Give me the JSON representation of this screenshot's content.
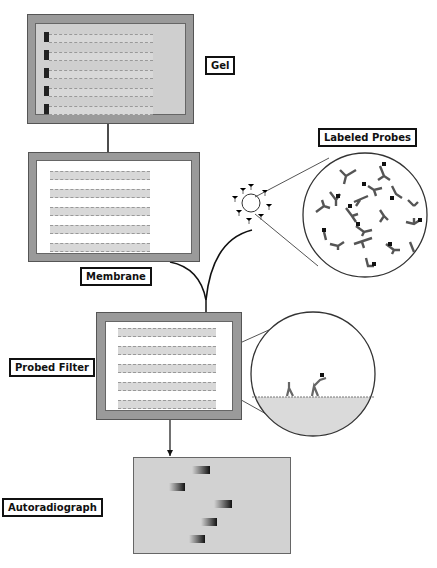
{
  "labels": {
    "gel": "Gel",
    "membrane": "Membrane",
    "labeled_probes": "Labeled Probes",
    "probed_filter": "Probed Filter",
    "autoradiograph": "Autoradiograph"
  },
  "colors": {
    "frame": "#9a9a9a",
    "gel_bg": "#cfcfcf",
    "film_bg": "#d2d2d2",
    "ink": "#111111"
  }
}
